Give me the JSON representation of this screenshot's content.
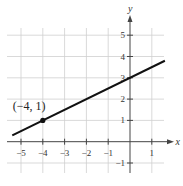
{
  "chart_data": {
    "type": "line",
    "title": "",
    "xlabel": "x",
    "ylabel": "y",
    "xlim": [
      -5.5,
      1.6
    ],
    "ylim": [
      -1.4,
      5.6
    ],
    "grid": true,
    "x_ticks": [
      -5,
      -4,
      -3,
      -2,
      -1,
      1
    ],
    "x_tick_labels": [
      "−5",
      "−4",
      "−3",
      "−2",
      "−1",
      "1"
    ],
    "y_ticks": [
      -1,
      1,
      2,
      3,
      4,
      5
    ],
    "y_tick_labels": [
      "−1",
      "1",
      "2",
      "3",
      "4",
      "5"
    ],
    "series": [
      {
        "name": "y = (1/2)x + 3",
        "slope": 0.5,
        "intercept": 3,
        "x": [
          -5.4,
          1.6
        ],
        "y": [
          0.3,
          3.8
        ],
        "color": "#111111"
      }
    ],
    "points": [
      {
        "x": -4,
        "y": 1,
        "label": "(−4, 1)"
      }
    ]
  }
}
